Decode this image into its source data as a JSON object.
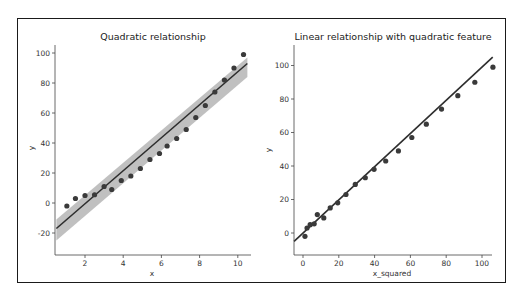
{
  "chart_data": [
    {
      "type": "scatter",
      "title": "Quadratic relationship",
      "xlabel": "x",
      "ylabel": "y",
      "xlim": [
        0.5,
        10.6
      ],
      "ylim": [
        -32,
        106
      ],
      "xticks": [
        2,
        4,
        6,
        8,
        10
      ],
      "yticks": [
        -20,
        0,
        20,
        40,
        60,
        80,
        100
      ],
      "grid": false,
      "legend": null,
      "series": [
        {
          "name": "data",
          "x": [
            1.05,
            1.5,
            2.0,
            2.5,
            3.0,
            3.4,
            3.9,
            4.4,
            4.9,
            5.4,
            5.9,
            6.3,
            6.8,
            7.3,
            7.8,
            8.3,
            8.8,
            9.3,
            9.8,
            10.3
          ],
          "y": [
            -2,
            3,
            5,
            5.5,
            11,
            9,
            15,
            18,
            23,
            29,
            33,
            38,
            43,
            49,
            57,
            65,
            74,
            82,
            90,
            99
          ]
        }
      ],
      "regression": {
        "x": [
          0.5,
          10.5
        ],
        "y": [
          -17,
          93
        ],
        "ci_upper": [
          -11,
          97
        ],
        "ci_lower": [
          -25,
          84
        ]
      }
    },
    {
      "type": "scatter",
      "title": "Linear relationship with quadratic feature",
      "xlabel": "x_squared",
      "ylabel": "y",
      "xlim": [
        -5,
        106
      ],
      "ylim": [
        -12,
        112
      ],
      "xticks": [
        0,
        20,
        40,
        60,
        80,
        100
      ],
      "yticks": [
        0,
        20,
        40,
        60,
        80,
        100
      ],
      "grid": false,
      "legend": null,
      "series": [
        {
          "name": "data",
          "x": [
            1.1,
            2.25,
            4.0,
            6.25,
            8.0,
            11.6,
            15.2,
            19.4,
            24.0,
            29.2,
            34.8,
            39.7,
            46.2,
            53.3,
            60.8,
            68.9,
            77.4,
            86.5,
            96.0,
            106.1
          ],
          "y": [
            -2,
            3,
            5,
            5.5,
            11,
            9,
            15,
            18,
            23,
            29,
            33,
            38,
            43,
            49,
            57,
            65,
            74,
            82,
            90,
            99
          ]
        }
      ],
      "regression": {
        "x": [
          -5,
          106
        ],
        "y": [
          -5,
          105
        ]
      }
    }
  ],
  "panels": {
    "left": {
      "title": "Quadratic relationship",
      "xlabel": "x",
      "ylabel": "y",
      "xtick_labels": [
        "2",
        "4",
        "6",
        "8",
        "10"
      ],
      "ytick_labels": [
        "-20",
        "0",
        "20",
        "40",
        "60",
        "80",
        "100"
      ]
    },
    "right": {
      "title": "Linear relationship with quadratic feature",
      "xlabel": "x_squared",
      "ylabel": "y",
      "xtick_labels": [
        "0",
        "20",
        "40",
        "60",
        "80",
        "100"
      ],
      "ytick_labels": [
        "0",
        "20",
        "40",
        "60",
        "80",
        "100"
      ]
    }
  },
  "colors": {
    "points": "#3a3a3a",
    "line": "#2e2e2e",
    "ci_band": "#b5b5b5",
    "axes": "#444444",
    "frame": "#1a1a1a"
  }
}
